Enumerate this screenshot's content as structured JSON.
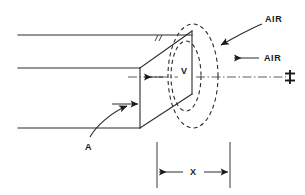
{
  "figure": {
    "background_color": "#ffffff",
    "line_color": "#2b2b2b",
    "text_color": "#1a1a1a"
  },
  "labels": {
    "air_upper": "AIR",
    "air_lower": "AIR",
    "velocity": "V",
    "area": "A",
    "distance": "X",
    "centerline_symbol": "℄"
  },
  "annotations": {
    "air_upper_leader": "curved-arrow-down-left",
    "air_lower_leader": "straight-arrow-left",
    "velocity_arrow": "arrow-left-on-centerline",
    "area_leader": "curved-arrow-up-right",
    "dimension_x": "double-headed-arrow"
  },
  "geometry": {
    "duct_top_line_y": 35,
    "duct_mid_line_y": 68,
    "duct_bottom_line_y": 128,
    "duct_left_x": 18,
    "face_near_x": 140,
    "face_far_x": 192,
    "face_top_y": 31,
    "face_bottom_y": 128,
    "centerline_y": 77,
    "vortex_center_x": 193,
    "vortex_center_y": 76,
    "vortex_outer_rx": 25,
    "vortex_outer_ry": 52,
    "vortex_inner_rx": 15,
    "vortex_inner_ry": 34,
    "dimension_left_x": 157,
    "dimension_right_x": 230,
    "dimension_line_y": 172,
    "extension_top_y": 142,
    "extension_bottom_y": 188
  }
}
